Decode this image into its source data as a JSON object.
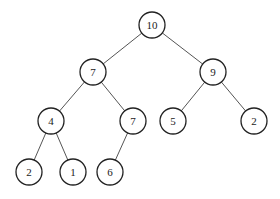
{
  "diagram": {
    "type": "binary-tree",
    "node_radius": 13,
    "nodes": [
      {
        "id": "n0",
        "label": "10",
        "x": 152,
        "y": 25
      },
      {
        "id": "n1",
        "label": "7",
        "x": 93,
        "y": 72
      },
      {
        "id": "n2",
        "label": "9",
        "x": 213,
        "y": 72
      },
      {
        "id": "n3",
        "label": "4",
        "x": 51,
        "y": 121
      },
      {
        "id": "n4",
        "label": "7",
        "x": 133,
        "y": 121
      },
      {
        "id": "n5",
        "label": "5",
        "x": 173,
        "y": 121
      },
      {
        "id": "n6",
        "label": "2",
        "x": 254,
        "y": 121
      },
      {
        "id": "n7",
        "label": "2",
        "x": 29,
        "y": 172
      },
      {
        "id": "n8",
        "label": "1",
        "x": 73,
        "y": 172
      },
      {
        "id": "n9",
        "label": "6",
        "x": 110,
        "y": 172
      }
    ],
    "edges": [
      [
        "n0",
        "n1"
      ],
      [
        "n0",
        "n2"
      ],
      [
        "n1",
        "n3"
      ],
      [
        "n1",
        "n4"
      ],
      [
        "n2",
        "n5"
      ],
      [
        "n2",
        "n6"
      ],
      [
        "n3",
        "n7"
      ],
      [
        "n3",
        "n8"
      ],
      [
        "n4",
        "n9"
      ]
    ]
  }
}
